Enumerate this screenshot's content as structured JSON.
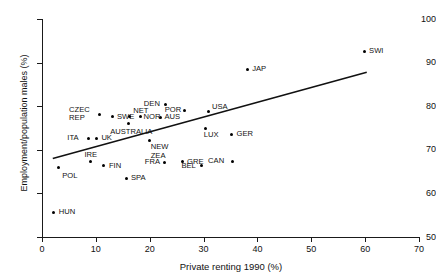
{
  "chart_data": {
    "type": "scatter",
    "title": "",
    "xlabel": "Private renting 1990 (%)",
    "ylabel": "Employment/population males (%)",
    "xlim": [
      0,
      70
    ],
    "ylim": [
      50,
      100
    ],
    "xticks": [
      0,
      10,
      20,
      30,
      40,
      50,
      60,
      70
    ],
    "yticks": [
      50,
      60,
      70,
      80,
      90,
      100
    ],
    "grid": false,
    "legend": null,
    "points": [
      {
        "label": "POL",
        "x": 3.0,
        "y": 66.0,
        "label_dx": 4,
        "label_dy": 5
      },
      {
        "label": "HUN",
        "x": 2.2,
        "y": 55.7,
        "label_dx": 5,
        "label_dy": -4
      },
      {
        "label": "ITA",
        "x": 8.6,
        "y": 72.7,
        "label_dx": -21,
        "label_dy": -4
      },
      {
        "label": "CZEC REP",
        "x": 10.6,
        "y": 78.0,
        "label_dx": -30,
        "label_dy": -9
      },
      {
        "label": "UK",
        "x": 10.1,
        "y": 72.7,
        "label_dx": 5,
        "label_dy": -4
      },
      {
        "label": "IRE",
        "x": 9.0,
        "y": 67.3,
        "label_dx": -6,
        "label_dy": -11
      },
      {
        "label": "FIN",
        "x": 11.5,
        "y": 66.3,
        "label_dx": 5,
        "label_dy": -4
      },
      {
        "label": "SWE",
        "x": 13.0,
        "y": 77.6,
        "label_dx": 5,
        "label_dy": -4
      },
      {
        "label": "NET",
        "x": 16.2,
        "y": 77.6,
        "label_dx": 0,
        "label_dy": -10
      },
      {
        "label": "AUSTRALIA",
        "x": 16.0,
        "y": 76.0,
        "label_dx": -18,
        "label_dy": 4
      },
      {
        "label": "NOR",
        "x": 18.3,
        "y": 77.6,
        "label_dx": 3,
        "label_dy": -4
      },
      {
        "label": "SPA",
        "x": 15.6,
        "y": 63.5,
        "label_dx": 5,
        "label_dy": -4
      },
      {
        "label": "DEN",
        "x": 23.0,
        "y": 80.4,
        "label_dx": -22,
        "label_dy": -4
      },
      {
        "label": "AUS",
        "x": 22.0,
        "y": 77.5,
        "label_dx": 4,
        "label_dy": -4
      },
      {
        "label": "NEW ZEA",
        "x": 20.0,
        "y": 72.2,
        "label_dx": 1,
        "label_dy": 3
      },
      {
        "label": "FRA",
        "x": 22.8,
        "y": 67.2,
        "label_dx": -20,
        "label_dy": -4
      },
      {
        "label": "POR",
        "x": 26.5,
        "y": 79.1,
        "label_dx": -20,
        "label_dy": -4
      },
      {
        "label": "GRE",
        "x": 26.0,
        "y": 67.3,
        "label_dx": 5,
        "label_dy": -4
      },
      {
        "label": "BEL",
        "x": 29.6,
        "y": 66.3,
        "label_dx": -20,
        "label_dy": -4
      },
      {
        "label": "LUX",
        "x": 30.4,
        "y": 75.0,
        "label_dx": -2,
        "label_dy": 3
      },
      {
        "label": "USA",
        "x": 31.0,
        "y": 78.7,
        "label_dx": 3,
        "label_dy": -9
      },
      {
        "label": "CAN",
        "x": 35.3,
        "y": 67.4,
        "label_dx": -24,
        "label_dy": -4
      },
      {
        "label": "GER",
        "x": 35.2,
        "y": 73.6,
        "label_dx": 5,
        "label_dy": -4
      },
      {
        "label": "JAP",
        "x": 38.1,
        "y": 88.5,
        "label_dx": 5,
        "label_dy": -4
      },
      {
        "label": "SWI",
        "x": 59.8,
        "y": 92.6,
        "label_dx": 5,
        "label_dy": -4
      }
    ],
    "trend_line": {
      "x0": 2.0,
      "y0": 68.0,
      "x1": 60.3,
      "y1": 87.8
    }
  },
  "axis": {
    "ytick_labels": [
      "100",
      "90",
      "80",
      "70",
      "60",
      "50"
    ],
    "xtick_labels": [
      "0",
      "10",
      "20",
      "30",
      "40",
      "50",
      "60",
      "70"
    ],
    "y_title": "Employment/population males (%)",
    "x_title": "Private renting 1990 (%)"
  }
}
